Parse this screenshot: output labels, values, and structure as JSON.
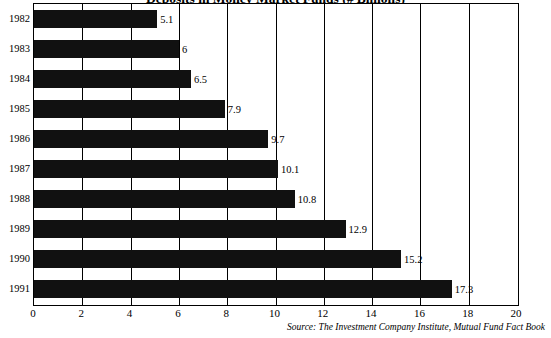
{
  "chart_data": {
    "type": "bar",
    "orientation": "horizontal",
    "title": "Deposits in Money Market Funds (# Billions)",
    "categories": [
      "1982",
      "1983",
      "1984",
      "1985",
      "1986",
      "1987",
      "1988",
      "1989",
      "1990",
      "1991"
    ],
    "values": [
      5.1,
      6,
      6.5,
      7.9,
      9.7,
      10.1,
      10.8,
      12.9,
      15.2,
      17.3
    ],
    "data_labels": [
      "5.1",
      "6",
      "6.5",
      "7.9",
      "9.7",
      "10.1",
      "10.8",
      "12.9",
      "15.2",
      "17.3"
    ],
    "xlabel": "",
    "ylabel": "",
    "xlim": [
      0,
      20
    ],
    "xticks": [
      0,
      2,
      4,
      6,
      8,
      10,
      12,
      14,
      16,
      18,
      20
    ],
    "xtick_labels": [
      "0",
      "2",
      "4",
      "6",
      "8",
      "10",
      "12",
      "14",
      "16",
      "18",
      "20"
    ],
    "grid": "vertical",
    "legend": "none",
    "bar_color": "#111111",
    "source": "Source: The Investment Company Institute, Mutual Fund Fact Book"
  }
}
